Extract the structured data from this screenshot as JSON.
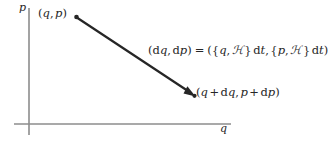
{
  "figure": {
    "background_color": "#ffffff",
    "width": 329,
    "height": 142
  },
  "axes": {
    "color": "#8c8c8c",
    "vertical": {
      "label": "p",
      "x": 29,
      "y_top": 8,
      "y_bottom": 135
    },
    "horizontal": {
      "label": "q",
      "y": 124,
      "x_left": 14,
      "x_right": 231
    }
  },
  "arrow": {
    "color": "#262626",
    "start": {
      "x": 76,
      "y": 17
    },
    "end": {
      "x": 195,
      "y": 96
    },
    "start_marker": "dot",
    "end_marker": "arrowhead"
  },
  "labels": {
    "start_point": {
      "open": "(",
      "q": "q",
      "comma": ",",
      "p": "p",
      "close": ")"
    },
    "end_point": {
      "open": "(",
      "q": "q",
      "plus1": "+",
      "d1": "d",
      "dq": "q",
      "comma": ",",
      "p": "p",
      "plus2": "+",
      "d2": "d",
      "dp": "p",
      "close": ")"
    },
    "displacement": {
      "lhs_open": "(",
      "d1": "d",
      "q": "q",
      "comma1": ",",
      "d2": "d",
      "p": "p",
      "lhs_close": ")",
      "equals": "=",
      "rhs_open": "(",
      "brace1_open": "{",
      "q2": "q",
      "comma2": ",",
      "hamiltonian1": "ℋ",
      "brace1_close": "}",
      "d3": "d",
      "t1": "t",
      "comma3": ",",
      "brace2_open": "{",
      "p2": "p",
      "comma4": ",",
      "hamiltonian2": "ℋ",
      "brace2_close": "}",
      "d4": "d",
      "t2": "t",
      "rhs_close": ")"
    }
  }
}
